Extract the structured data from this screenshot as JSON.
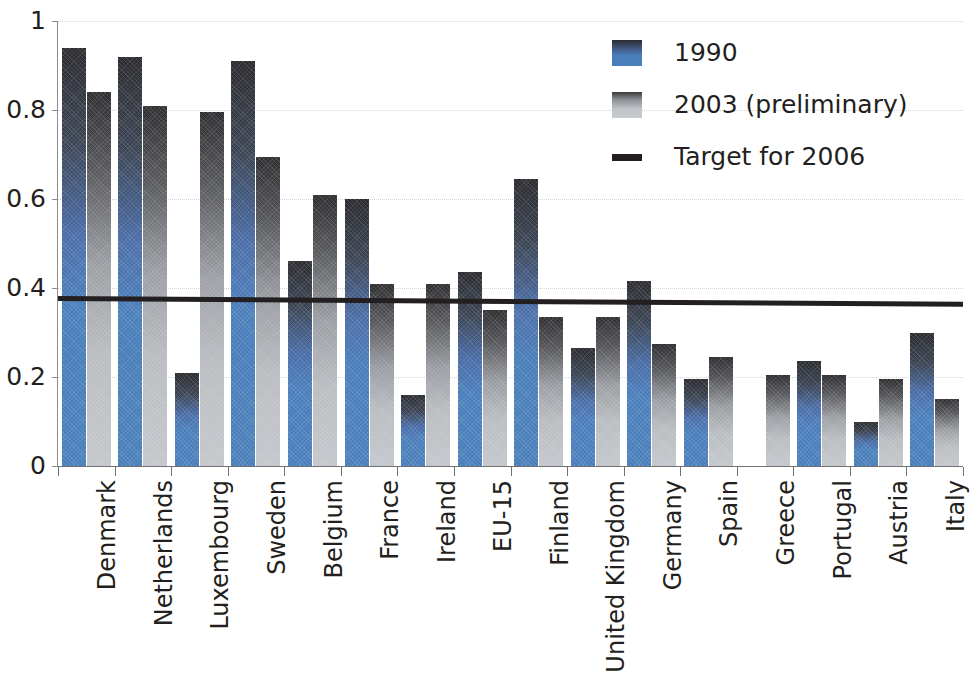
{
  "chart_data": {
    "type": "bar",
    "title": "",
    "subtitle": "",
    "xlabel": "",
    "ylabel": "",
    "ylim": [
      0,
      1
    ],
    "xlim_categories": 16,
    "grid": true,
    "grid_axis": "y",
    "legend_position": "top-right",
    "categories": [
      "Denmark",
      "Netherlands",
      "Luxembourg",
      "Sweden",
      "Belgium",
      "France",
      "Ireland",
      "EU-15",
      "Finland",
      "United Kingdom",
      "Germany",
      "Spain",
      "Greece",
      "Portugal",
      "Austria",
      "Italy"
    ],
    "series": [
      {
        "name": "1990",
        "color": "#4a7ebb",
        "values": [
          0.94,
          0.92,
          0.21,
          0.91,
          0.46,
          0.6,
          0.16,
          0.435,
          0.645,
          0.265,
          0.415,
          0.195,
          null,
          0.235,
          0.1,
          0.3
        ]
      },
      {
        "name": "2003 (preliminary)",
        "color": "#c3c6ca",
        "values": [
          0.84,
          0.81,
          0.795,
          0.695,
          0.61,
          0.41,
          0.41,
          0.35,
          0.335,
          0.335,
          0.275,
          0.245,
          0.205,
          0.205,
          0.195,
          0.15
        ]
      }
    ],
    "reference_line": {
      "name": "Target for 2006",
      "color": "#231f20",
      "value_left": 0.378,
      "value_right": 0.365
    },
    "y_ticks": [
      "0",
      "0.2",
      "0.4",
      "0.6",
      "0.8",
      "1"
    ],
    "y_tick_values": [
      0,
      0.2,
      0.4,
      0.6,
      0.8,
      1
    ]
  },
  "legend": {
    "items": [
      {
        "label": "1990",
        "swatch": "bar-blue-swatch"
      },
      {
        "label": "2003 (preliminary)",
        "swatch": "bar-gray-swatch"
      },
      {
        "label": "Target for 2006",
        "swatch": "target-line-swatch"
      }
    ]
  }
}
